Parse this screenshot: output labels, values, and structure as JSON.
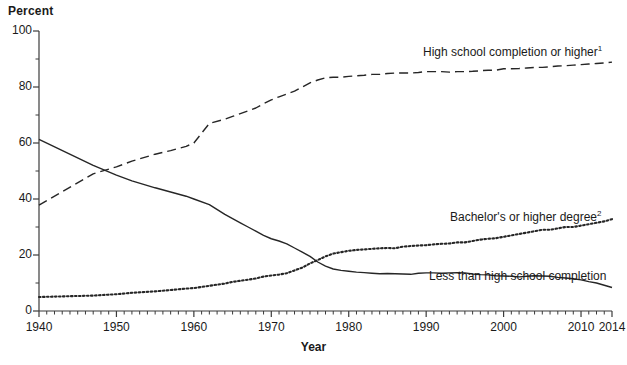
{
  "chart_data": {
    "type": "line",
    "title": "",
    "xlabel": "Year",
    "ylabel": "Percent",
    "xlim": [
      1940,
      2014
    ],
    "ylim": [
      0,
      100
    ],
    "grid": false,
    "legend_position": "inline-annotations",
    "y_ticks_major": [
      0,
      20,
      40,
      60,
      80,
      100
    ],
    "y_ticks_minor": [
      10,
      30,
      50,
      70,
      90
    ],
    "x_ticks_labeled": [
      1940,
      1950,
      1960,
      1970,
      1980,
      1990,
      2000,
      2010,
      2014
    ],
    "x_tick_interval_minor": 1,
    "series": [
      {
        "name": "High school completion or higher",
        "footnote": "1",
        "style": "dashed",
        "label_x": 1996,
        "label_y": 91,
        "x": [
          1940,
          1947,
          1950,
          1952,
          1955,
          1957,
          1959,
          1960,
          1962,
          1964,
          1965,
          1966,
          1967,
          1968,
          1969,
          1970,
          1971,
          1972,
          1973,
          1974,
          1975,
          1976,
          1977,
          1978,
          1979,
          1980,
          1981,
          1982,
          1983,
          1984,
          1985,
          1986,
          1987,
          1988,
          1989,
          1990,
          1991,
          1992,
          1993,
          1994,
          1995,
          1996,
          1997,
          1998,
          1999,
          2000,
          2001,
          2002,
          2003,
          2004,
          2005,
          2006,
          2007,
          2008,
          2009,
          2010,
          2011,
          2012,
          2013,
          2014
        ],
        "values": [
          37.8,
          49.0,
          51.5,
          53.5,
          56.0,
          57.3,
          58.8,
          60.0,
          67.0,
          68.5,
          69.5,
          70.5,
          71.5,
          72.5,
          74.0,
          75.4,
          76.5,
          77.5,
          78.5,
          80.0,
          81.5,
          82.5,
          83.3,
          83.5,
          83.5,
          83.8,
          84.0,
          84.2,
          84.5,
          84.5,
          84.8,
          85.0,
          85.0,
          85.0,
          85.2,
          85.5,
          85.5,
          85.5,
          85.3,
          85.5,
          85.5,
          85.6,
          85.8,
          86.0,
          86.0,
          86.5,
          86.5,
          86.6,
          86.8,
          87.0,
          87.0,
          87.2,
          87.5,
          87.6,
          87.8,
          88.0,
          88.2,
          88.4,
          88.6,
          88.9
        ]
      },
      {
        "name": "Less than high school completion",
        "footnote": "",
        "style": "solid",
        "label_x": 1998,
        "label_y": 17,
        "x": [
          1940,
          1947,
          1950,
          1952,
          1955,
          1957,
          1959,
          1960,
          1962,
          1964,
          1965,
          1966,
          1967,
          1968,
          1969,
          1970,
          1971,
          1972,
          1973,
          1974,
          1975,
          1976,
          1977,
          1978,
          1979,
          1980,
          1981,
          1982,
          1983,
          1984,
          1985,
          1986,
          1987,
          1988,
          1989,
          1990,
          1991,
          1992,
          1993,
          1994,
          1995,
          1996,
          1997,
          1998,
          1999,
          2000,
          2001,
          2002,
          2003,
          2004,
          2005,
          2006,
          2007,
          2008,
          2009,
          2010,
          2011,
          2012,
          2013,
          2014
        ],
        "values": [
          61.3,
          52.0,
          48.5,
          46.5,
          44.0,
          42.5,
          41.0,
          40.0,
          38.0,
          34.5,
          33.0,
          31.5,
          30.0,
          28.5,
          27.0,
          25.8,
          25.0,
          24.0,
          22.5,
          21.0,
          19.5,
          17.5,
          16.0,
          15.0,
          14.5,
          14.2,
          13.9,
          13.7,
          13.5,
          13.3,
          13.4,
          13.3,
          13.2,
          13.1,
          13.5,
          13.6,
          13.6,
          13.5,
          13.6,
          13.7,
          13.6,
          13.2,
          13.0,
          12.9,
          12.6,
          12.5,
          12.4,
          12.2,
          12.4,
          12.6,
          12.5,
          12.4,
          12.0,
          11.8,
          11.5,
          11.1,
          10.5,
          10.0,
          9.2,
          8.4
        ]
      },
      {
        "name": "Bachelor's or higher degree",
        "footnote": "2",
        "style": "dotted",
        "label_x": 1996,
        "label_y": 39,
        "x": [
          1940,
          1947,
          1950,
          1952,
          1955,
          1957,
          1959,
          1960,
          1962,
          1964,
          1965,
          1966,
          1967,
          1968,
          1969,
          1970,
          1971,
          1972,
          1973,
          1974,
          1975,
          1976,
          1977,
          1978,
          1979,
          1980,
          1981,
          1982,
          1983,
          1984,
          1985,
          1986,
          1987,
          1988,
          1989,
          1990,
          1991,
          1992,
          1993,
          1994,
          1995,
          1996,
          1997,
          1998,
          1999,
          2000,
          2001,
          2002,
          2003,
          2004,
          2005,
          2006,
          2007,
          2008,
          2009,
          2010,
          2011,
          2012,
          2013,
          2014
        ],
        "values": [
          5.0,
          5.5,
          6.0,
          6.5,
          7.0,
          7.5,
          8.0,
          8.2,
          9.0,
          9.8,
          10.4,
          10.8,
          11.2,
          11.6,
          12.3,
          12.7,
          13.0,
          13.5,
          14.5,
          15.5,
          17.0,
          18.2,
          19.5,
          20.5,
          21.0,
          21.5,
          21.8,
          22.0,
          22.2,
          22.4,
          22.5,
          22.4,
          23.0,
          23.2,
          23.4,
          23.5,
          23.8,
          24.0,
          24.1,
          24.5,
          24.5,
          25.0,
          25.5,
          25.8,
          26.0,
          26.5,
          27.0,
          27.5,
          28.0,
          28.5,
          29.0,
          29.0,
          29.5,
          30.0,
          30.0,
          30.5,
          31.0,
          31.5,
          32.0,
          32.8
        ]
      }
    ]
  },
  "axes": {
    "y_title": "Percent",
    "x_title": "Year"
  }
}
